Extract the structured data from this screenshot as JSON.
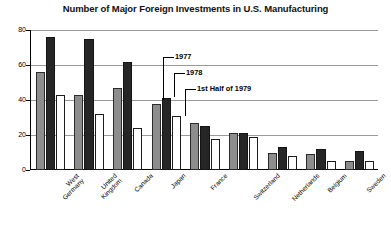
{
  "chart_data": {
    "type": "bar",
    "title": "Number of Major Foreign Investments in U.S. Manufacturing",
    "xlabel": "",
    "ylabel": "",
    "ylim": [
      0,
      80
    ],
    "yticks": [
      0,
      20,
      40,
      60,
      80
    ],
    "ytick_labels": [
      "0",
      "20",
      "40",
      "60",
      "80"
    ],
    "grid": true,
    "legend_position": "annotations-on-japan-group",
    "categories": [
      "West Germany",
      "United Kingdom",
      "Canada",
      "Japan",
      "France",
      "Switzerland",
      "Netherlands",
      "Belgium",
      "Sweden"
    ],
    "series": [
      {
        "name": "1977",
        "color": "#8d8d8d",
        "values": [
          56,
          43,
          47,
          38,
          27,
          21,
          10,
          9,
          5
        ]
      },
      {
        "name": "1978",
        "color": "#262626",
        "values": [
          76,
          75,
          62,
          41,
          25,
          21,
          13,
          12,
          11
        ]
      },
      {
        "name": "1st Half of 1979",
        "color": "#ffffff",
        "values": [
          43,
          32,
          24,
          31,
          18,
          19,
          8,
          5,
          5
        ]
      }
    ],
    "annotations": [
      {
        "text": "1977",
        "target_series": "1977",
        "target_category": "Japan"
      },
      {
        "text": "1978",
        "target_series": "1978",
        "target_category": "Japan"
      },
      {
        "text": "1st Half of 1979",
        "target_series": "1st Half of 1979",
        "target_category": "Japan"
      }
    ]
  }
}
